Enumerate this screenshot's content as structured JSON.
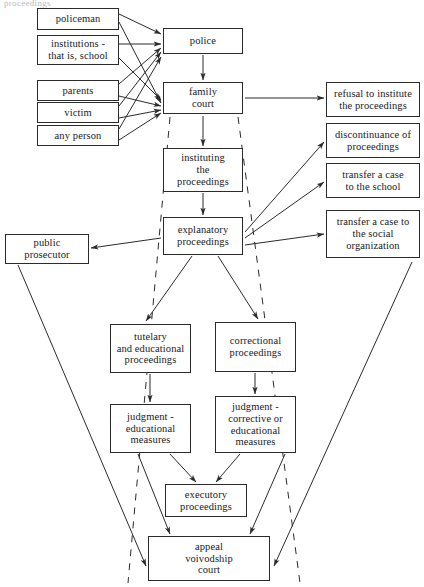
{
  "diagram": {
    "title_fragment": "proceedings",
    "stroke_color": "#2b2b2b",
    "background": "#ffffff",
    "nodes": [
      {
        "id": "policeman",
        "label": "policeman",
        "x": 37,
        "y": 8,
        "w": 82,
        "h": 22
      },
      {
        "id": "institutions",
        "label": "institutions -\nthat is, school",
        "x": 37,
        "y": 35,
        "w": 82,
        "h": 30
      },
      {
        "id": "parents",
        "label": "parents",
        "x": 37,
        "y": 80,
        "w": 82,
        "h": 21
      },
      {
        "id": "victim",
        "label": "victim",
        "x": 37,
        "y": 102,
        "w": 82,
        "h": 21
      },
      {
        "id": "any-person",
        "label": "any person",
        "x": 37,
        "y": 125,
        "w": 82,
        "h": 21
      },
      {
        "id": "police",
        "label": "police",
        "x": 163,
        "y": 28,
        "w": 80,
        "h": 26
      },
      {
        "id": "family-court",
        "label": "family\ncourt",
        "x": 163,
        "y": 82,
        "w": 80,
        "h": 32
      },
      {
        "id": "instituting",
        "label": "instituting\nthe\nproceedings",
        "x": 163,
        "y": 148,
        "w": 80,
        "h": 44
      },
      {
        "id": "explanatory",
        "label": "explanatory\nproceedings",
        "x": 163,
        "y": 217,
        "w": 80,
        "h": 38
      },
      {
        "id": "refusal",
        "label": "refusal to institute\nthe proceedings",
        "x": 326,
        "y": 82,
        "w": 94,
        "h": 35
      },
      {
        "id": "discontinuance",
        "label": "discontinuance of\nproceedings",
        "x": 326,
        "y": 123,
        "w": 94,
        "h": 35
      },
      {
        "id": "transfer-school",
        "label": "transfer a case\nto the school",
        "x": 326,
        "y": 163,
        "w": 94,
        "h": 35
      },
      {
        "id": "transfer-social",
        "label": "transfer a case to\nthe social\norganization",
        "x": 326,
        "y": 210,
        "w": 94,
        "h": 48
      },
      {
        "id": "prosecutor",
        "label": "public\nprosecutor",
        "x": 5,
        "y": 234,
        "w": 84,
        "h": 30
      },
      {
        "id": "tutelary",
        "label": "tutelary\nand educational\nproceedings",
        "x": 110,
        "y": 324,
        "w": 81,
        "h": 49
      },
      {
        "id": "correctional",
        "label": "correctional\nproceedings",
        "x": 215,
        "y": 322,
        "w": 81,
        "h": 50
      },
      {
        "id": "judgment-edu",
        "label": "judgment -\neducational\nmeasures",
        "x": 110,
        "y": 404,
        "w": 81,
        "h": 49
      },
      {
        "id": "judgment-corr",
        "label": "judgment -\ncorrective or\neducational\nmeasures",
        "x": 215,
        "y": 396,
        "w": 81,
        "h": 57
      },
      {
        "id": "executory",
        "label": "executory\nproceedings",
        "x": 165,
        "y": 484,
        "w": 82,
        "h": 33
      },
      {
        "id": "appeal",
        "label": "appeal\nvoivodship\ncourt",
        "x": 148,
        "y": 536,
        "w": 122,
        "h": 45
      }
    ],
    "edges": [
      {
        "from": "policeman",
        "to": "police",
        "style": "solid",
        "x1": 119,
        "y1": 14,
        "x2": 161,
        "y2": 34
      },
      {
        "from": "policeman",
        "to": "family-court",
        "style": "solid",
        "x1": 119,
        "y1": 22,
        "x2": 161,
        "y2": 103
      },
      {
        "from": "institutions",
        "to": "police",
        "style": "solid",
        "x1": 119,
        "y1": 44,
        "x2": 161,
        "y2": 44
      },
      {
        "from": "institutions",
        "to": "family-court",
        "style": "solid",
        "x1": 119,
        "y1": 58,
        "x2": 161,
        "y2": 100
      },
      {
        "from": "parents",
        "to": "police",
        "style": "solid",
        "x1": 119,
        "y1": 84,
        "x2": 161,
        "y2": 48
      },
      {
        "from": "parents",
        "to": "family-court",
        "style": "solid",
        "x1": 119,
        "y1": 96,
        "x2": 161,
        "y2": 106
      },
      {
        "from": "victim",
        "to": "police",
        "style": "solid",
        "x1": 119,
        "y1": 106,
        "x2": 161,
        "y2": 52
      },
      {
        "from": "victim",
        "to": "family-court",
        "style": "solid",
        "x1": 119,
        "y1": 118,
        "x2": 161,
        "y2": 110
      },
      {
        "from": "any-person",
        "to": "police",
        "style": "solid",
        "x1": 119,
        "y1": 129,
        "x2": 161,
        "y2": 57
      },
      {
        "from": "any-person",
        "to": "family-court",
        "style": "solid",
        "x1": 119,
        "y1": 140,
        "x2": 161,
        "y2": 113
      },
      {
        "from": "police",
        "to": "family-court",
        "style": "solid",
        "x1": 203,
        "y1": 55,
        "x2": 203,
        "y2": 80
      },
      {
        "from": "family-court",
        "to": "refusal",
        "style": "solid",
        "x1": 245,
        "y1": 98,
        "x2": 324,
        "y2": 98
      },
      {
        "from": "family-court",
        "to": "instituting",
        "style": "solid",
        "x1": 203,
        "y1": 116,
        "x2": 203,
        "y2": 146
      },
      {
        "from": "instituting",
        "to": "explanatory",
        "style": "solid",
        "x1": 203,
        "y1": 193,
        "x2": 203,
        "y2": 215
      },
      {
        "from": "explanatory",
        "to": "discontinuance",
        "style": "solid",
        "x1": 245,
        "y1": 232,
        "x2": 324,
        "y2": 142
      },
      {
        "from": "explanatory",
        "to": "transfer-school",
        "style": "solid",
        "x1": 245,
        "y1": 238,
        "x2": 324,
        "y2": 182
      },
      {
        "from": "explanatory",
        "to": "transfer-social",
        "style": "solid",
        "x1": 245,
        "y1": 245,
        "x2": 324,
        "y2": 234
      },
      {
        "from": "explanatory",
        "to": "prosecutor",
        "style": "solid",
        "x1": 161,
        "y1": 238,
        "x2": 91,
        "y2": 248
      },
      {
        "from": "explanatory",
        "to": "tutelary",
        "style": "solid",
        "x1": 192,
        "y1": 256,
        "x2": 146,
        "y2": 321
      },
      {
        "from": "explanatory",
        "to": "correctional",
        "style": "solid",
        "x1": 218,
        "y1": 256,
        "x2": 258,
        "y2": 319
      },
      {
        "from": "tutelary",
        "to": "judgment-edu",
        "style": "solid",
        "x1": 150,
        "y1": 374,
        "x2": 150,
        "y2": 402
      },
      {
        "from": "correctional",
        "to": "judgment-corr",
        "style": "solid",
        "x1": 255,
        "y1": 373,
        "x2": 255,
        "y2": 394
      },
      {
        "from": "judgment-edu",
        "to": "executory",
        "style": "solid",
        "x1": 170,
        "y1": 454,
        "x2": 196,
        "y2": 482
      },
      {
        "from": "judgment-corr",
        "to": "executory",
        "style": "solid",
        "x1": 240,
        "y1": 454,
        "x2": 216,
        "y2": 482
      },
      {
        "from": "judgment-edu",
        "to": "appeal",
        "style": "solid",
        "x1": 138,
        "y1": 454,
        "x2": 170,
        "y2": 534
      },
      {
        "from": "judgment-corr",
        "to": "appeal",
        "style": "solid",
        "x1": 285,
        "y1": 454,
        "x2": 250,
        "y2": 534
      },
      {
        "from": "prosecutor",
        "to": "appeal",
        "style": "solid",
        "x1": 18,
        "y1": 265,
        "x2": 146,
        "y2": 566
      },
      {
        "from": "transfer-social",
        "to": "appeal",
        "style": "solid",
        "x1": 412,
        "y1": 262,
        "x2": 274,
        "y2": 566
      },
      {
        "from": "family-court",
        "to": "appeal",
        "style": "dashed",
        "x1": 170,
        "y1": 117,
        "x2": 128,
        "y2": 583
      },
      {
        "from": "family-court",
        "to": "appeal",
        "style": "dashed",
        "x1": 238,
        "y1": 117,
        "x2": 300,
        "y2": 583
      }
    ]
  }
}
